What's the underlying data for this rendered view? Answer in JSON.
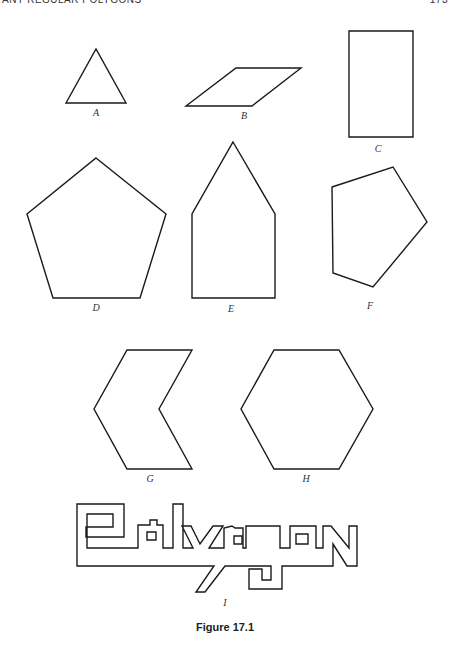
{
  "page": {
    "running_head": "ANY REGULAR POLYGONS",
    "page_number": "173"
  },
  "figure": {
    "caption": "Figure 17.1",
    "shapes": [
      {
        "id": "A",
        "label": "A",
        "kind": "triangle",
        "points": "66,103 96,49 126,103",
        "label_x": 96,
        "label_y": 110
      },
      {
        "id": "B",
        "label": "B",
        "kind": "parallelogram",
        "points": "186,106 236,68 301,68 252,106",
        "label_x": 244,
        "label_y": 113
      },
      {
        "id": "C",
        "label": "C",
        "kind": "rectangle",
        "points": "349,31 413,31 413,137 349,137",
        "label_x": 378,
        "label_y": 145
      },
      {
        "id": "D",
        "label": "D",
        "kind": "regular-pentagon",
        "points": "96,158 166,214 140,298 53,298 27,214",
        "label_x": 96,
        "label_y": 304
      },
      {
        "id": "E",
        "label": "E",
        "kind": "house-pentagon",
        "points": "233,142 275,214 275,298 192,298 192,214",
        "label_x": 231,
        "label_y": 305
      },
      {
        "id": "F",
        "label": "F",
        "kind": "irregular-pentagon",
        "points": "332,187 393,167 427,222 373,287 333,273",
        "label_x": 370,
        "label_y": 302
      },
      {
        "id": "G",
        "label": "G",
        "kind": "chevron-hexagon",
        "points": "127,350 192,350 159,409 192,469 127,469 94,409",
        "label_x": 150,
        "label_y": 475
      },
      {
        "id": "H",
        "label": "H",
        "kind": "regular-hexagon",
        "points": "274,350 339,350 373,409 339,469 274,469 241,409",
        "label_x": 306,
        "label_y": 475
      },
      {
        "id": "I",
        "label": "I",
        "kind": "polygon-word",
        "label_x": 225,
        "label_y": 594
      }
    ]
  }
}
